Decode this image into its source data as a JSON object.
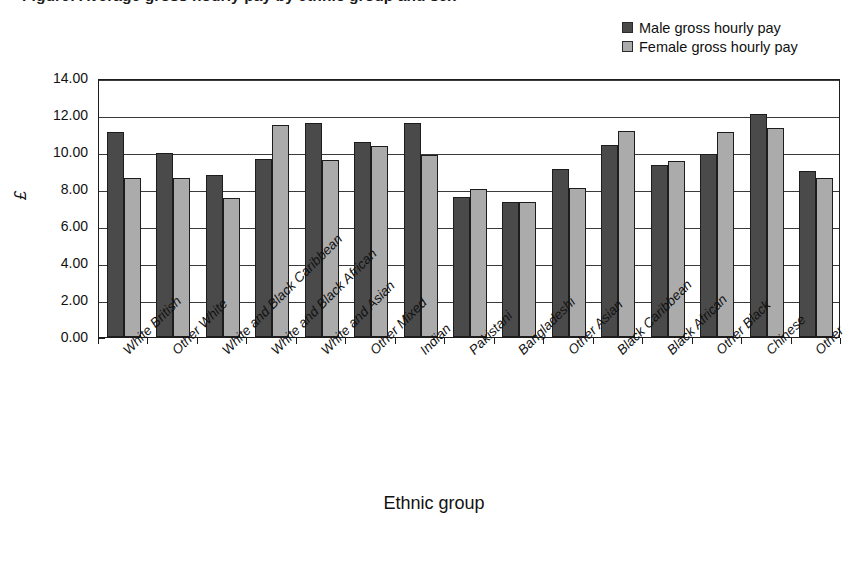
{
  "figure": {
    "title": "Figure: Average gross hourly pay by ethnic group and sex",
    "x_axis_title": "Ethnic group",
    "y_axis_title": "£"
  },
  "legend": {
    "position": "top-right",
    "entries": [
      {
        "label": "Male gross hourly pay",
        "color": "#4a4a4a"
      },
      {
        "label": "Female gross hourly pay",
        "color": "#ababab"
      }
    ]
  },
  "colors": {
    "male_bar": "#4a4a4a",
    "female_bar": "#ababab",
    "axis": "#1d1d1d",
    "gridline": "#3a3a3a",
    "background": "#ffffff"
  },
  "chart_data": {
    "type": "bar",
    "title": "Figure: Average gross hourly pay by ethnic group and sex",
    "xlabel": "Ethnic group",
    "ylabel": "£",
    "ylim": [
      0.0,
      14.0
    ],
    "ytick_step": 2.0,
    "ytick_labels": [
      "0.00",
      "2.00",
      "4.00",
      "6.00",
      "8.00",
      "10.00",
      "12.00",
      "14.00"
    ],
    "grid": true,
    "legend_position": "top-right",
    "categories": [
      "White British",
      "Other White",
      "White and Black Caribbean",
      "White and Black African",
      "White and Asian",
      "Other Mixed",
      "Indian",
      "Pakistani",
      "Bangladeshi",
      "Other Asian",
      "Black Caribbean",
      "Black African",
      "Other Black",
      "Chinese",
      "Other"
    ],
    "series": [
      {
        "name": "Male gross hourly pay",
        "color": "#4a4a4a",
        "values": [
          11.1,
          9.95,
          8.75,
          9.6,
          11.55,
          10.55,
          11.55,
          7.55,
          7.3,
          9.1,
          10.4,
          9.3,
          9.9,
          12.05,
          8.95
        ]
      },
      {
        "name": "Female gross hourly pay",
        "color": "#ababab",
        "values": [
          8.6,
          8.6,
          7.5,
          11.45,
          9.55,
          10.3,
          9.85,
          8.0,
          7.3,
          8.05,
          11.15,
          9.5,
          11.1,
          11.3,
          8.6
        ]
      }
    ]
  }
}
